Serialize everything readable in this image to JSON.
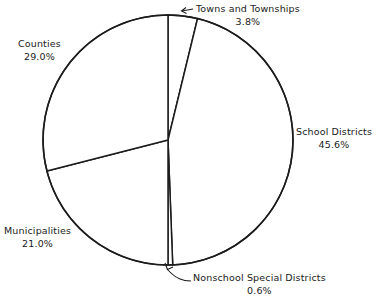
{
  "chart_data": {
    "type": "pie",
    "title": "",
    "subtitle": "",
    "xlabel": "",
    "ylabel": "",
    "legend_position": "none",
    "grid": false,
    "units": "percent",
    "start_angle_deg": 0,
    "direction": "clockwise",
    "categories": [
      "Towns and Townships",
      "School Districts",
      "Nonschool Special Districts",
      "Municipalities",
      "Counties"
    ],
    "values": [
      3.8,
      45.6,
      0.6,
      21.0,
      29.0
    ],
    "slices": [
      {
        "label": "Towns and Townships",
        "value": 3.8,
        "value_text": "3.8%",
        "start_deg": 0.0,
        "end_deg": 13.68,
        "label_placement": "outside-leader"
      },
      {
        "label": "School Districts",
        "value": 45.6,
        "value_text": "45.6%",
        "start_deg": 13.68,
        "end_deg": 177.84,
        "label_placement": "outside"
      },
      {
        "label": "Nonschool Special Districts",
        "value": 0.6,
        "value_text": "0.6%",
        "start_deg": 177.84,
        "end_deg": 180.0,
        "label_placement": "outside-leader"
      },
      {
        "label": "Municipalities",
        "value": 21.0,
        "value_text": "21.0%",
        "start_deg": 180.0,
        "end_deg": 255.6,
        "label_placement": "outside"
      },
      {
        "label": "Counties",
        "value": 29.0,
        "value_text": "29.0%",
        "start_deg": 255.6,
        "end_deg": 360.0,
        "label_placement": "outside"
      }
    ],
    "colors": {
      "slice_fill": "#ffffff",
      "slice_stroke": "#1c1c1c",
      "text": "#1a1a1a",
      "background": "#ffffff"
    }
  },
  "labels": {
    "towns": {
      "name": "Towns and Townships",
      "value": "3.8%"
    },
    "school": {
      "name": "School Districts",
      "value": "45.6%"
    },
    "nonschool": {
      "name": "Nonschool Special Districts",
      "value": "0.6%"
    },
    "municipalities": {
      "name": "Municipalities",
      "value": "21.0%"
    },
    "counties": {
      "name": "Counties",
      "value": "29.0%"
    }
  }
}
